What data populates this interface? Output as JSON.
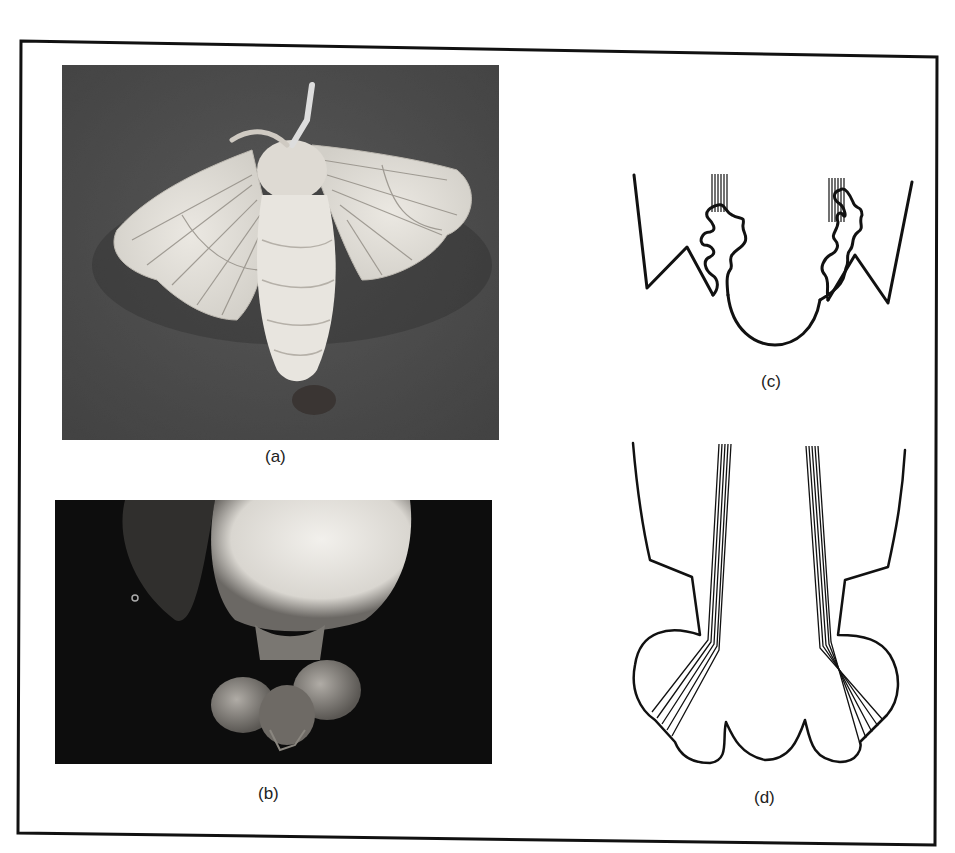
{
  "figure": {
    "panels": [
      {
        "id": "a",
        "label": "(a)",
        "type": "photograph",
        "subject": "moth-top-view"
      },
      {
        "id": "b",
        "label": "(b)",
        "type": "photograph",
        "subject": "abdomen-tip-close-up"
      },
      {
        "id": "c",
        "label": "(c)",
        "type": "line-drawing",
        "subject": "retracted-glands-diagram"
      },
      {
        "id": "d",
        "label": "(d)",
        "type": "line-drawing",
        "subject": "everted-glands-diagram"
      }
    ],
    "colors": {
      "ink": "#111111",
      "paper": "#ffffff",
      "photo_a_bg": "#4a4a4a",
      "photo_b_bg": "#0e0e0e",
      "moth_body": "#e6e3dc"
    }
  }
}
